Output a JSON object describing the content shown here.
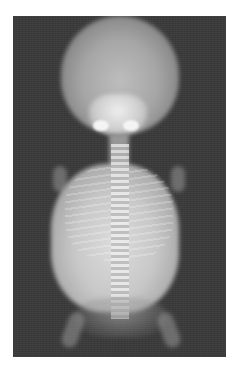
{
  "image": {
    "type": "radiograph",
    "subject": "fetal skeleton x-ray",
    "background_color": "#3a3a3a",
    "border_color": "#ffffff"
  }
}
